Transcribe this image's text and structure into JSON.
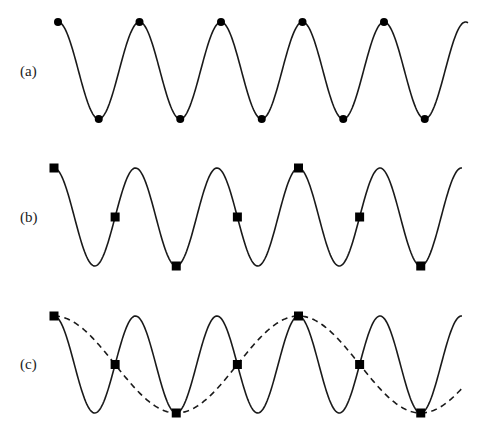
{
  "figure": {
    "panels": [
      {
        "id": "a",
        "label": "(a)",
        "signal": {
          "function": "cos",
          "frequency_cycles_per_unit": 1,
          "t_start": 0,
          "t_end": 5.0
        },
        "samples": {
          "marker": "circle",
          "interval_cycles": 0.5,
          "t": [
            0,
            0.5,
            1,
            1.5,
            2,
            2.5,
            3,
            3.5,
            4,
            4.5
          ]
        },
        "alias": null
      },
      {
        "id": "b",
        "label": "(b)",
        "signal": {
          "function": "cos",
          "frequency_cycles_per_unit": 1,
          "t_start": 0,
          "t_end": 5.0
        },
        "samples": {
          "marker": "square",
          "interval_cycles": 0.75,
          "t": [
            0,
            0.75,
            1.5,
            2.25,
            3,
            3.75,
            4.5
          ]
        },
        "alias": null
      },
      {
        "id": "c",
        "label": "(c)",
        "signal": {
          "function": "cos",
          "frequency_cycles_per_unit": 1,
          "t_start": 0,
          "t_end": 5.0
        },
        "samples": {
          "marker": "square",
          "interval_cycles": 0.75,
          "t": [
            0,
            0.75,
            1.5,
            2.25,
            3,
            3.75,
            4.5
          ]
        },
        "alias": {
          "function": "cos",
          "frequency_cycles_per_unit": 0.3333,
          "t_start": 0,
          "t_end": 5.0,
          "style": "dashed"
        }
      }
    ],
    "colors": {
      "line": "#1a1a1a",
      "marker": "#000000",
      "background": "#ffffff"
    }
  }
}
